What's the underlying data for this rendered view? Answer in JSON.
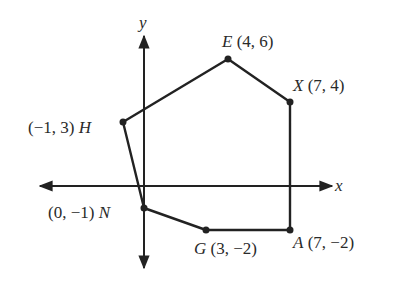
{
  "figure": {
    "type": "coordinate-plane-polygon",
    "axes": {
      "x_label": "x",
      "y_label": "y",
      "color": "#222222"
    },
    "polygon_color": "#222222",
    "points": [
      {
        "name": "E",
        "coords": "(4, 6)",
        "x": 4,
        "y": 6
      },
      {
        "name": "X",
        "coords": "(7, 4)",
        "x": 7,
        "y": 4
      },
      {
        "name": "A",
        "coords": "(7, −2)",
        "x": 7,
        "y": -2
      },
      {
        "name": "G",
        "coords": "(3, −2)",
        "x": 3,
        "y": -2
      },
      {
        "name": "N",
        "coords": "(0, −1)",
        "x": 0,
        "y": -1
      },
      {
        "name": "H",
        "coords": "(−1, 3)",
        "x": -1,
        "y": 3
      }
    ],
    "polygon_order": [
      "E",
      "X",
      "A",
      "G",
      "N",
      "H"
    ]
  }
}
